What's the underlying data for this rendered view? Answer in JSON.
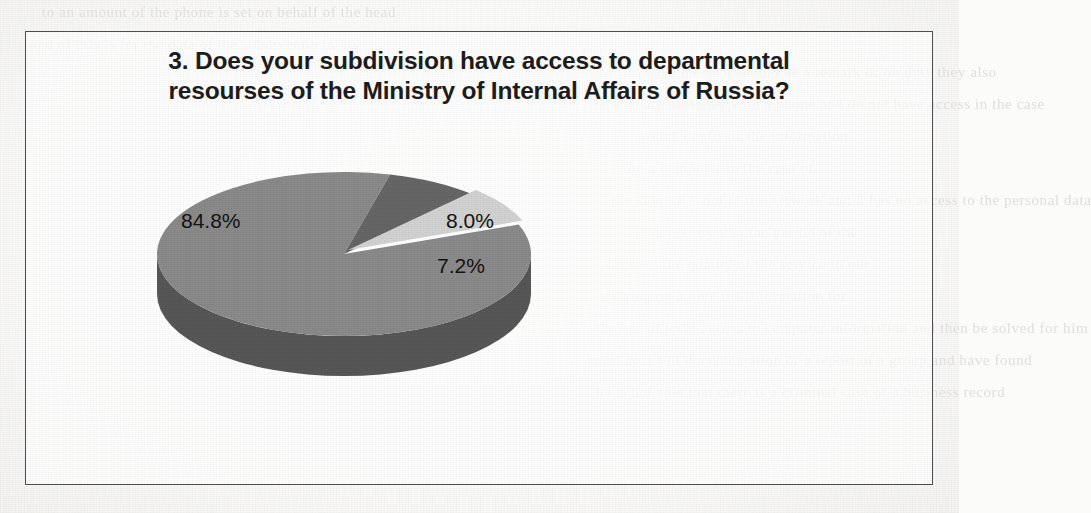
{
  "document": {
    "page_background_color": "#fbfbfa",
    "frame_border_color": "#4e4e4e"
  },
  "figure": {
    "title_line_1": "3. Does your subdivision have access to departmental",
    "title_line_2": "resourses of the Ministry of Internal Affairs of Russia?"
  },
  "chart_data": {
    "type": "pie",
    "title": "3. Does your subdivision have access to departmental resourses of the Ministry of Internal Affairs of Russia?",
    "xlabel": "",
    "ylabel": "",
    "three_d": true,
    "legend": "none",
    "grid": false,
    "data_labels": [
      "84.8%",
      "8.0%",
      "7.2%"
    ],
    "categories": [
      "Slice 1",
      "Slice 2",
      "Slice 3"
    ],
    "values": [
      84.8,
      8.0,
      7.2
    ],
    "slices": [
      {
        "label": "84.8%",
        "value": 84.8,
        "color": "#8a8a8a",
        "side_color": "#575757",
        "exploded": false
      },
      {
        "label": "8.0%",
        "value": 8.0,
        "color": "#666666",
        "side_color": "#454545",
        "exploded": false
      },
      {
        "label": "7.2%",
        "value": 7.2,
        "color": "#d2d2d2",
        "side_color": "#9a9a9a",
        "exploded": true
      }
    ]
  },
  "scan_artifacts": {
    "ghost_lines": [
      "to  an amount of  the  phone  is   set  on  behalf  of  the  head",
      "and  of  this  is  for  the  data  of  the  subdivision  in   his",
      "have  no  such  should   be  a  remark   or   on   duty   they  also",
      "who  are  provided  with  a   phone  and  do  not  have  access  in  the  case",
      "which  confirms  the  information",
      "on   a  computer  in   the   case   of",
      "the  subject  is  not  in  the  network  and  it   has  no   access  to   the   personal  data",
      "is  necessary  that  the  period  of   the",
      "improve  the  quality  of  the  service  to  our",
      "training  on  a  time  the  information  for",
      "the  use  of  local  access  to   computer  information  and   then  be  solved  for  him",
      "must  be  a  full   documentation  or   a  report  of   a  group  and  have  found",
      "he   is  not  able  that   there  is   a  criminal  case  of  a  business  record"
    ]
  }
}
